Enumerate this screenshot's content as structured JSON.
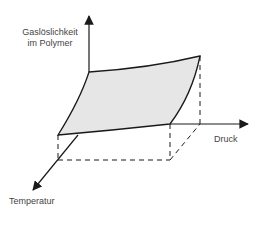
{
  "diagram": {
    "type": "3d-surface-sketch",
    "axes": {
      "vertical": {
        "label_line1": "Gaslöslichkeit",
        "label_line2": "im Polymer"
      },
      "horizontal": {
        "label": "Druck"
      },
      "depth": {
        "label": "Temperatur"
      }
    },
    "colors": {
      "surface_fill": "#e6e6e6",
      "line": "#1a1a1a",
      "text": "#444444"
    }
  }
}
